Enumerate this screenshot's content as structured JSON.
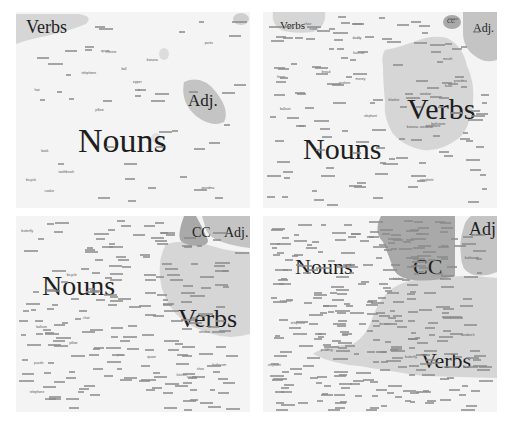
{
  "figure": {
    "panels": [
      {
        "id": "top-left",
        "labels": {
          "nouns": "Nouns",
          "verbs": "Verbs",
          "adj": "Adj."
        },
        "words": [
          "grandma",
          "hair",
          "pants",
          "pillow",
          "banana",
          "cookie",
          "spoon",
          "ball",
          "book",
          "telephone",
          "bicycle",
          "toothbrush",
          "cheese",
          "zipper"
        ]
      },
      {
        "id": "top-right",
        "labels": {
          "nouns": "Nouns",
          "verbs": "Verbs",
          "adj": "Adj.",
          "cc": "CC"
        },
        "words": [
          "grandma",
          "daddy",
          "elephant",
          "bathroom",
          "window",
          "balloon",
          "airplane",
          "chair",
          "mouth",
          "tongue",
          "finger",
          "hand",
          "spaghetti",
          "banana, sandwich",
          "money",
          "bread",
          "bathtub",
          "book",
          "telephone",
          "blanket"
        ]
      },
      {
        "id": "bottom-left",
        "labels": {
          "nouns": "Nouns",
          "verbs": "Verbs",
          "adj": "Adj.",
          "cc": "CC"
        },
        "words": [
          "bathroom",
          "kitchen",
          "telephone",
          "pillow",
          "window",
          "butterfly",
          "chair",
          "shoe",
          "spoon",
          "pizza",
          "puzzle",
          "bicycle",
          "balloon",
          "crayon"
        ]
      },
      {
        "id": "bottom-right",
        "labels": {
          "nouns": "Nouns",
          "verbs": "Verbs",
          "adj": "Adj.",
          "cc": "CC"
        },
        "words": [
          "bathroom",
          "telephone",
          "kitchen",
          "butterfly",
          "elephant",
          "sandwich",
          "pudding",
          "banana",
          "cookie",
          "popsicle"
        ]
      }
    ],
    "colors": {
      "background": "#f4f4f4",
      "noun_region": "#f4f4f4",
      "verb_region": "#d6d6d6",
      "adj_region": "#c4c4c4",
      "cc_region": "#a9a9a9",
      "label_text": "#1e1e1e"
    }
  }
}
